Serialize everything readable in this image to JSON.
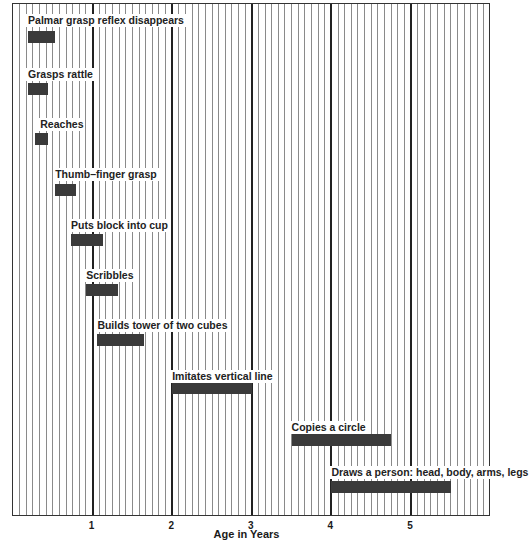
{
  "chart_data": {
    "type": "bar",
    "subtype": "horizontal-range (gantt)",
    "title": "",
    "xlabel": "Age in Years",
    "ylabel": "",
    "xlim": [
      0,
      6
    ],
    "x_ticks": [
      "1",
      "2",
      "3",
      "4",
      "5"
    ],
    "grid": {
      "vertical_minor_per_year": 12,
      "major_every_year": true,
      "horizontal": false
    },
    "legend": null,
    "milestones": [
      {
        "label": "Palmar grasp reflex disappears",
        "start": 0.19,
        "end": 0.53
      },
      {
        "label": "Grasps rattle",
        "start": 0.19,
        "end": 0.44
      },
      {
        "label": "Reaches",
        "start": 0.28,
        "end": 0.44
      },
      {
        "label": "Thumb–finger grasp",
        "start": 0.53,
        "end": 0.79
      },
      {
        "label": "Puts block into cup",
        "start": 0.73,
        "end": 1.13
      },
      {
        "label": "Scribbles",
        "start": 0.92,
        "end": 1.32
      },
      {
        "label": "Builds tower of two cubes",
        "start": 1.06,
        "end": 1.65
      },
      {
        "label": "Imitates vertical line",
        "start": 2.0,
        "end": 3.0
      },
      {
        "label": "Copies a circle",
        "start": 3.5,
        "end": 4.75
      },
      {
        "label": "Draws a person: head, body, arms, legs",
        "start": 4.0,
        "end": 5.5
      }
    ]
  },
  "layout": {
    "px_per_year": 79.6,
    "rows": [
      {
        "label_top": 10,
        "bar_top": 27
      },
      {
        "label_top": 64,
        "bar_top": 79
      },
      {
        "label_top": 114,
        "bar_top": 129
      },
      {
        "label_top": 164,
        "bar_top": 180
      },
      {
        "label_top": 215,
        "bar_top": 230
      },
      {
        "label_top": 265,
        "bar_top": 280
      },
      {
        "label_top": 315,
        "bar_top": 330
      },
      {
        "label_top": 366,
        "bar_top": 378
      },
      {
        "label_top": 417,
        "bar_top": 430
      },
      {
        "label_top": 462,
        "bar_top": 477
      }
    ],
    "label_offsets": [
      0,
      0,
      5,
      0,
      0,
      0,
      0,
      0,
      0,
      0
    ]
  }
}
